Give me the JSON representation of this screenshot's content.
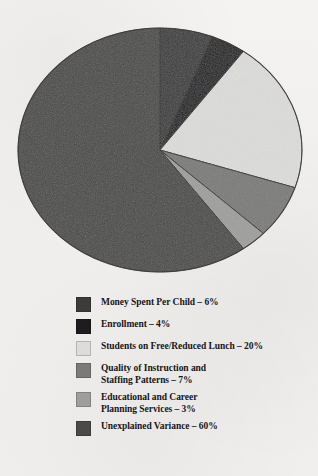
{
  "chart_data": {
    "type": "pie",
    "title": "",
    "subtitle": "",
    "xlabel": "",
    "ylabel": "",
    "legend_position": "bottom",
    "grid": false,
    "start_angle_deg": 0,
    "direction": "clockwise",
    "units": "percent",
    "total": 100,
    "categories": [
      "Money Spent Per Child",
      "Enrollment",
      "Students on Free/Reduced Lunch",
      "Quality of Instruction and Staffing Patterns",
      "Educational and Career Planning Services",
      "Unexplained Variance"
    ],
    "values": [
      6,
      4,
      20,
      7,
      3,
      60
    ],
    "colors": [
      "#3b3b3b",
      "#1d1d1f",
      "#dcdcda",
      "#7a7a78",
      "#9e9e9c",
      "#4a4a48"
    ],
    "slices": [
      {
        "label": "Money Spent Per Child",
        "value": 6,
        "color": "#3b3b3b"
      },
      {
        "label": "Enrollment",
        "value": 4,
        "color": "#1d1d1f"
      },
      {
        "label": "Students on Free/Reduced Lunch",
        "value": 20,
        "color": "#dcdcda"
      },
      {
        "label": "Quality of Instruction and Staffing Patterns",
        "value": 7,
        "color": "#7a7a78"
      },
      {
        "label": "Educational and Career Planning Services",
        "value": 3,
        "color": "#9e9e9c"
      },
      {
        "label": "Unexplained Variance",
        "value": 60,
        "color": "#4a4a48"
      }
    ]
  },
  "header": {
    "title": ""
  },
  "legend": {
    "items": [
      {
        "label": "Money Spent Per Child – 6%",
        "color": "#3b3b3b"
      },
      {
        "label": "Enrollment – 4%",
        "color": "#1d1d1f"
      },
      {
        "label": "Students on Free/Reduced Lunch – 20%",
        "color": "#dcdcda"
      },
      {
        "label": "Quality of Instruction and\nStaffing Patterns – 7%",
        "color": "#7a7a78"
      },
      {
        "label": "Educational and Career\nPlanning Services – 3%",
        "color": "#9e9e9c"
      },
      {
        "label": "Unexplained Variance – 60%",
        "color": "#4a4a48"
      }
    ]
  },
  "colors": {
    "page_background": "#f2f1ef",
    "text": "#17161a",
    "slice_outline": "#2b2b2b"
  }
}
